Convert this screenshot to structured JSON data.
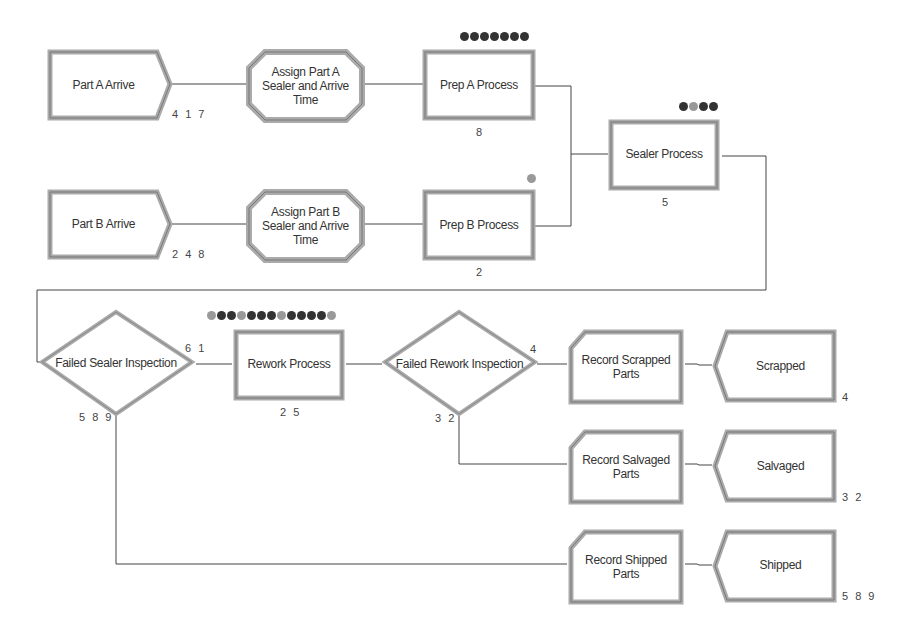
{
  "diagram": {
    "type": "flowchart",
    "tool_style": "Arena simulation model",
    "nodes": [
      {
        "id": "part_a_arrive",
        "type": "create",
        "label": "Part A Arrive",
        "count": "4 1 7"
      },
      {
        "id": "assign_a",
        "type": "assign",
        "label": "Assign Part A Sealer and Arrive Time",
        "lines": [
          "Assign Part A",
          "Sealer and Arrive",
          "Time"
        ]
      },
      {
        "id": "prep_a",
        "type": "process",
        "label": "Prep A Process",
        "count": "8",
        "queue": [
          "#333",
          "#333",
          "#333",
          "#333",
          "#333",
          "#333",
          "#333"
        ]
      },
      {
        "id": "part_b_arrive",
        "type": "create",
        "label": "Part B Arrive",
        "count": "2 4 8"
      },
      {
        "id": "assign_b",
        "type": "assign",
        "label": "Assign Part B Sealer and Arrive Time",
        "lines": [
          "Assign Part B",
          "Sealer and Arrive",
          "Time"
        ]
      },
      {
        "id": "prep_b",
        "type": "process",
        "label": "Prep B Process",
        "count": "2",
        "queue": [
          "#999"
        ]
      },
      {
        "id": "sealer",
        "type": "process",
        "label": "Sealer Process",
        "count": "5",
        "queue": [
          "#333",
          "#999",
          "#333",
          "#333"
        ]
      },
      {
        "id": "failed_sealer",
        "type": "decide",
        "label": "Failed Sealer Inspection",
        "count_true": "6 1",
        "count_false": "5 8 9"
      },
      {
        "id": "rework",
        "type": "process",
        "label": "Rework Process",
        "count": "2 5",
        "queue": [
          "#999",
          "#333",
          "#333",
          "#999",
          "#333",
          "#333",
          "#333",
          "#999",
          "#333",
          "#333",
          "#333",
          "#333",
          "#999"
        ]
      },
      {
        "id": "failed_rework",
        "type": "decide",
        "label": "Failed Rework Inspection",
        "count_true": "4",
        "count_false": "3 2"
      },
      {
        "id": "record_scrapped",
        "type": "record",
        "label": "Record Scrapped Parts",
        "lines": [
          "Record Scrapped",
          "Parts"
        ]
      },
      {
        "id": "scrapped",
        "type": "dispose",
        "label": "Scrapped",
        "count": "4"
      },
      {
        "id": "record_salvaged",
        "type": "record",
        "label": "Record Salvaged Parts",
        "lines": [
          "Record Salvaged",
          "Parts"
        ]
      },
      {
        "id": "salvaged",
        "type": "dispose",
        "label": "Salvaged",
        "count": "3 2"
      },
      {
        "id": "record_shipped",
        "type": "record",
        "label": "Record Shipped Parts",
        "lines": [
          "Record Shipped",
          "Parts"
        ]
      },
      {
        "id": "shipped",
        "type": "dispose",
        "label": "Shipped",
        "count": "5 8 9"
      }
    ],
    "edges": [
      {
        "from": "part_a_arrive",
        "to": "assign_a"
      },
      {
        "from": "assign_a",
        "to": "prep_a"
      },
      {
        "from": "prep_a",
        "to": "sealer"
      },
      {
        "from": "part_b_arrive",
        "to": "assign_b"
      },
      {
        "from": "assign_b",
        "to": "prep_b"
      },
      {
        "from": "prep_b",
        "to": "sealer"
      },
      {
        "from": "sealer",
        "to": "failed_sealer"
      },
      {
        "from": "failed_sealer",
        "to": "rework",
        "label": "True"
      },
      {
        "from": "failed_sealer",
        "to": "record_shipped",
        "label": "False"
      },
      {
        "from": "rework",
        "to": "failed_rework"
      },
      {
        "from": "failed_rework",
        "to": "record_scrapped",
        "label": "True"
      },
      {
        "from": "failed_rework",
        "to": "record_salvaged",
        "label": "False"
      },
      {
        "from": "record_scrapped",
        "to": "scrapped"
      },
      {
        "from": "record_salvaged",
        "to": "salvaged"
      },
      {
        "from": "record_shipped",
        "to": "shipped"
      }
    ]
  },
  "colors": {
    "border_light": "#c8c8c8",
    "border_dark": "#8a8a8a",
    "line": "#444444",
    "entity_dark": "#333333",
    "entity_light": "#999999"
  }
}
